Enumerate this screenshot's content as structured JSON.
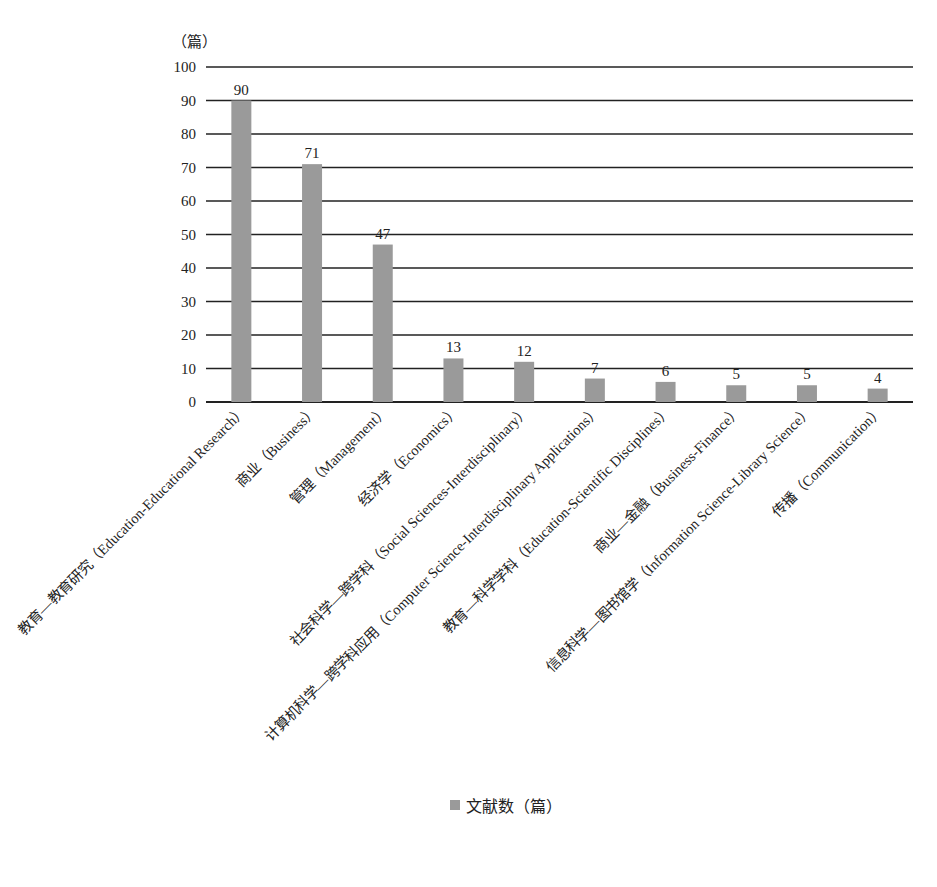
{
  "chart_data": {
    "type": "bar",
    "title": "",
    "ylabel": "（篇）",
    "xlabel": "",
    "ylim": [
      0,
      100
    ],
    "yticks": [
      0,
      10,
      20,
      30,
      40,
      50,
      60,
      70,
      80,
      90,
      100
    ],
    "grid": true,
    "legend_position": "bottom",
    "categories": [
      "教育—教育研究（Education-Educational Research）",
      "商业（Business）",
      "管理（Management）",
      "经济学（Economics）",
      "社会科学—跨学科（Social Sciences-Interdisciplinary）",
      "计算机科学—跨学科应用（Computer Science-Interdisciplinary Applications）",
      "教育—科学学科（Education-Scientific Disciplines）",
      "商业—金融（Business-Finance）",
      "信息科学—图书馆学（Information Science-Library Science）",
      "传播（Communication）"
    ],
    "series": [
      {
        "name": "文献数（篇）",
        "values": [
          90,
          71,
          47,
          13,
          12,
          7,
          6,
          5,
          5,
          4
        ],
        "color": "#9a9a9a"
      }
    ]
  },
  "legend": {
    "label": "文献数（篇）"
  },
  "unit_label": "（篇）"
}
